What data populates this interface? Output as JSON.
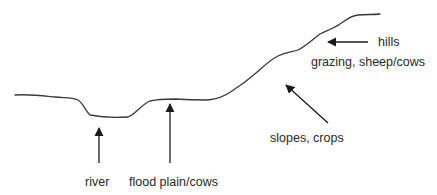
{
  "diagram": {
    "type": "land-use cross-section profile",
    "colors": {
      "line": "#3a3a3a",
      "text": "#2a2a2a",
      "background": "#ffffff"
    },
    "labels": {
      "river": "river",
      "flood_plain": "flood plain/cows",
      "slopes": "slopes, crops",
      "hills_title": "hills",
      "hills_use": "grazing, sheep/cows"
    }
  }
}
